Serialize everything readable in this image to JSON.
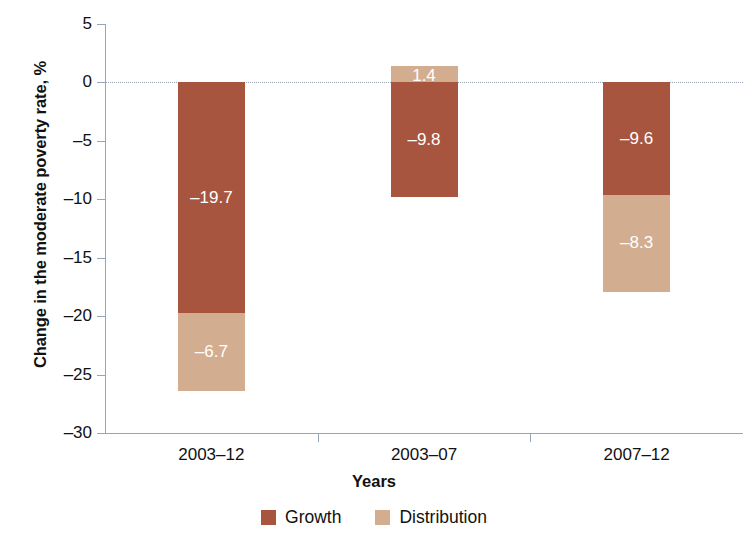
{
  "chart_data": {
    "type": "bar",
    "subtype": "stacked-bar-with-negative-values",
    "title": "",
    "xlabel": "Years",
    "ylabel": "Change in the moderate poverty rate, %",
    "categories": [
      "2003–12",
      "2003–07",
      "2007–12"
    ],
    "series": [
      {
        "name": "Growth",
        "color": "#a8553f",
        "values": [
          -19.7,
          -9.8,
          -9.6
        ],
        "labels": [
          "–19.7",
          "–9.8",
          "–9.6"
        ]
      },
      {
        "name": "Distribution",
        "color": "#d3ad8f",
        "values": [
          -6.7,
          1.4,
          -8.3
        ],
        "labels": [
          "–6.7",
          "1.4",
          "–8.3"
        ]
      }
    ],
    "totals": [
      -26.4,
      -8.4,
      -17.9
    ],
    "ylim": [
      -30,
      5
    ],
    "yticks": [
      5,
      0,
      -5,
      -10,
      -15,
      -20,
      -25,
      -30
    ],
    "ytick_labels": [
      "5",
      "0",
      "–5",
      "–10",
      "–15",
      "–20",
      "–25",
      "–30"
    ],
    "grid": false,
    "zero_reference_line": true,
    "legend_position": "bottom",
    "legend": [
      "Growth",
      "Distribution"
    ],
    "colors": {
      "growth": "#a8553f",
      "distribution": "#d3ad8f",
      "axis": "#97a5ba",
      "zero_line": "#9aa3b0",
      "text": "#111111",
      "data_label": "#ffffff",
      "background": "#ffffff"
    }
  }
}
